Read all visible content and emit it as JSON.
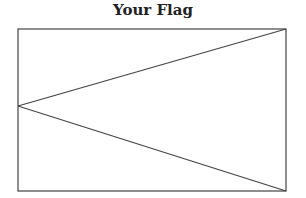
{
  "title": "Your Flag",
  "flag": {
    "rect": {
      "x": 18,
      "y": 29,
      "width": 268,
      "height": 162
    },
    "lines": [
      {
        "x1": 18,
        "y1": 106,
        "x2": 286,
        "y2": 29
      },
      {
        "x1": 18,
        "y1": 106,
        "x2": 286,
        "y2": 191
      }
    ],
    "stroke_color": "#444444",
    "fill_color": "#ffffff"
  }
}
